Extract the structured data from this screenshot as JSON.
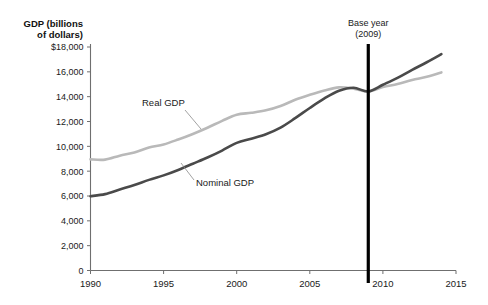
{
  "chart_data": {
    "type": "line",
    "title": "",
    "xlabel": "",
    "ylabel": "GDP (billions of dollars)",
    "ylim": [
      0,
      18000
    ],
    "xlim": [
      1990,
      2015
    ],
    "grid": false,
    "legend_position": "inline-annotations",
    "y_ticks": [
      "0",
      "2,000",
      "4,000",
      "6,000",
      "8,000",
      "10,000",
      "12,000",
      "14,000",
      "16,000",
      "$18,000"
    ],
    "y_tick_values": [
      0,
      2000,
      4000,
      6000,
      8000,
      10000,
      12000,
      14000,
      16000,
      18000
    ],
    "x_ticks": [
      "1990",
      "1995",
      "2000",
      "2005",
      "2010",
      "2015"
    ],
    "x_tick_values": [
      1990,
      1995,
      2000,
      2005,
      2010,
      2015
    ],
    "x": [
      1990,
      1991,
      1992,
      1993,
      1994,
      1995,
      1996,
      1997,
      1998,
      1999,
      2000,
      2001,
      2002,
      2003,
      2004,
      2005,
      2006,
      2007,
      2008,
      2009,
      2010,
      2011,
      2012,
      2013,
      2014
    ],
    "series": [
      {
        "name": "Real GDP",
        "color": "#b9b9b9",
        "values": [
          8950,
          8930,
          9250,
          9500,
          9900,
          10150,
          10550,
          11000,
          11500,
          12050,
          12550,
          12700,
          12900,
          13250,
          13750,
          14150,
          14500,
          14750,
          14650,
          14420,
          14780,
          15020,
          15350,
          15600,
          15950
        ]
      },
      {
        "name": "Nominal GDP",
        "color": "#4a4a4a",
        "values": [
          5980,
          6150,
          6520,
          6880,
          7300,
          7660,
          8100,
          8600,
          9100,
          9660,
          10280,
          10620,
          10980,
          11510,
          12270,
          13090,
          13860,
          14480,
          14720,
          14420,
          14960,
          15520,
          16160,
          16770,
          17420
        ]
      }
    ],
    "annotations": [
      {
        "name": "base-year",
        "text_line1": "Base year",
        "text_line2": "(2009)",
        "x_value": 2009
      },
      {
        "name": "real-gdp-label",
        "text": "Real GDP"
      },
      {
        "name": "nominal-gdp-label",
        "text": "Nominal GDP"
      }
    ],
    "colors": {
      "real_gdp": "#b9b9b9",
      "nominal_gdp": "#4a4a4a",
      "base_year_line": "#000000",
      "axis": "#6f6f6f",
      "background": "#ffffff"
    }
  },
  "axis": {
    "y_title_line1": "GDP (billions",
    "y_title_line2": "of dollars)"
  }
}
